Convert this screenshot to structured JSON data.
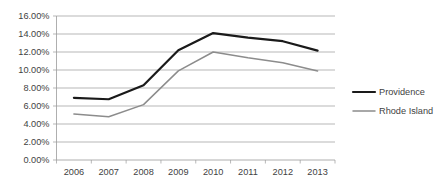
{
  "chart_data": {
    "type": "line",
    "title": "",
    "subtitle": "",
    "xlabel": "",
    "ylabel": "",
    "categories": [
      "2006",
      "2007",
      "2008",
      "2009",
      "2010",
      "2011",
      "2012",
      "2013"
    ],
    "series": [
      {
        "name": "Providence",
        "color": "#1a1a1a",
        "stroke_width": 2.2,
        "values": [
          6.9,
          6.75,
          8.3,
          12.2,
          14.1,
          13.6,
          13.2,
          12.15
        ]
      },
      {
        "name": "Rhode Island",
        "color": "#8c8c8c",
        "stroke_width": 1.5,
        "values": [
          5.1,
          4.8,
          6.15,
          9.9,
          12.0,
          11.35,
          10.8,
          9.9
        ]
      }
    ],
    "ylim": [
      0,
      16
    ],
    "ytick_values": [
      0,
      2,
      4,
      6,
      8,
      10,
      12,
      14,
      16
    ],
    "ytick_labels": [
      "0.00%",
      "2.00%",
      "4.00%",
      "6.00%",
      "8.00%",
      "10.00%",
      "12.00%",
      "14.00%",
      "16.00%"
    ],
    "grid": true,
    "grid_axis": "y",
    "legend_position": "right",
    "legend_entries": [
      "Providence",
      "Rhode Island"
    ],
    "annotations": []
  },
  "colors": {
    "providence": "#1a1a1a",
    "rhode_island": "#8c8c8c",
    "grid": "#9a9a9a",
    "text": "#3f3f3f",
    "background": "#ffffff"
  }
}
